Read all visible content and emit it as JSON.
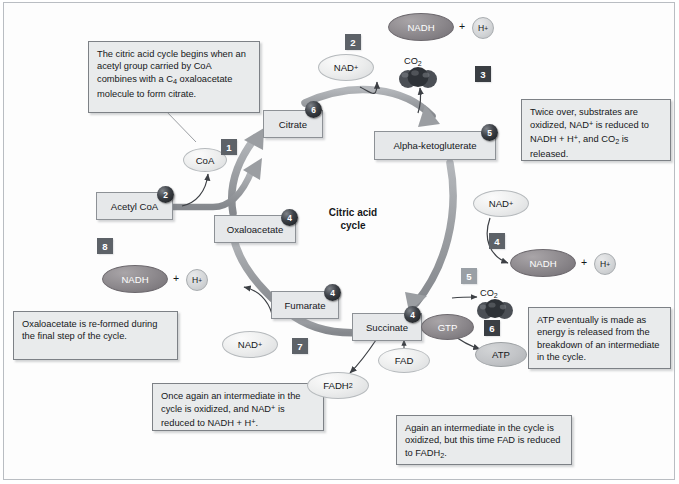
{
  "diagram": {
    "center_title_line1": "Citric acid",
    "center_title_line2": "cycle"
  },
  "callouts": [
    {
      "id": "callout-intro",
      "html": "The citric acid cycle begins when an acetyl group carried by CoA combines with a C<sub>4</sub> oxaloacetate molecule to form citrate."
    },
    {
      "id": "callout-oxidized-twice",
      "html": "Twice over, substrates are oxidized, NAD<sup>+</sup> is reduced to NADH + H<sup>+</sup>, and CO<sub>2</sub> is released."
    },
    {
      "id": "callout-atp",
      "html": "ATP eventually is made as energy is released from the breakdown of an intermediate in the cycle."
    },
    {
      "id": "callout-fad",
      "html": "Again an intermediate in the cycle is oxidized, but this time FAD is reduced to FADH<sub>2</sub>."
    },
    {
      "id": "callout-nad-again",
      "html": "Once again an intermediate in the cycle is oxidized, and NAD<sup>+</sup> is reduced to NADH + H<sup>+</sup>."
    },
    {
      "id": "callout-oxaloacetate-reformed",
      "html": "Oxaloacetate is re-formed during the final step of the cycle."
    }
  ],
  "metabolites": [
    {
      "id": "metab-citrate",
      "label": "Citrate",
      "carbons": "6"
    },
    {
      "id": "metab-alpha-ketogluterate",
      "label": "Alpha-ketogluterate",
      "carbons": "5"
    },
    {
      "id": "metab-acetyl-coa",
      "label": "Acetyl CoA",
      "carbons": "2"
    },
    {
      "id": "metab-oxaloacetate",
      "label": "Oxaloacetate",
      "carbons": "4"
    },
    {
      "id": "metab-fumarate",
      "label": "Fumarate",
      "carbons": "4"
    },
    {
      "id": "metab-succinate",
      "label": "Succinate",
      "carbons": "4"
    }
  ],
  "molecules": {
    "coa": "CoA",
    "nad_top": "NAD<sup>+</sup>",
    "nadh_top": "NADH",
    "hplus_top": "H<sup>+</sup>",
    "co2_top": "CO<sub>2</sub>",
    "nad_right": "NAD<sup>+</sup>",
    "nadh_right": "NADH",
    "hplus_right": "H<sup>+</sup>",
    "co2_right": "CO<sub>2</sub>",
    "nadh_left": "NADH",
    "hplus_left": "H<sup>+</sup>",
    "nad_bottom": "NAD<sup>+</sup>",
    "gtp": "GTP",
    "atp": "ATP",
    "fad": "FAD",
    "fadh2": "FADH<sub>2</sub>",
    "plus_top": "+",
    "plus_right": "+",
    "plus_left": "+"
  },
  "steps": [
    {
      "id": "step-1",
      "label": "1"
    },
    {
      "id": "step-2",
      "label": "2"
    },
    {
      "id": "step-3",
      "label": "3"
    },
    {
      "id": "step-4",
      "label": "4"
    },
    {
      "id": "step-5",
      "label": "5"
    },
    {
      "id": "step-6",
      "label": "6"
    },
    {
      "id": "step-7",
      "label": "7"
    },
    {
      "id": "step-8",
      "label": "8"
    }
  ],
  "colors": {
    "page_background": "#ffffff",
    "callout_fill": "#e9ebec",
    "callout_border": "#7d8186",
    "metabolite_fill": "#e6e8ea",
    "metabolite_border": "#8d9196",
    "cycle_arrow": "#9b9ea2",
    "thin_arrow": "#3d4045",
    "step_box": "#5d6268",
    "carbon_badge": "#16181b",
    "nadh_oval": "#8e8a8e",
    "gtp_oval": "#8e8a8e",
    "text": "#15171a"
  },
  "chart_data": {
    "type": "diagram",
    "title": "Citric acid cycle",
    "nodes": [
      {
        "name": "Acetyl CoA",
        "carbons": 2
      },
      {
        "name": "Oxaloacetate",
        "carbons": 4
      },
      {
        "name": "Citrate",
        "carbons": 6
      },
      {
        "name": "Alpha-ketogluterate",
        "carbons": 5
      },
      {
        "name": "Succinate",
        "carbons": 4
      },
      {
        "name": "Fumarate",
        "carbons": 4
      }
    ],
    "steps": [
      {
        "number": 1,
        "description": "CoA is released as acetyl group joins oxaloacetate to form citrate"
      },
      {
        "number": 2,
        "description": "NAD+ is reduced to NADH + H+"
      },
      {
        "number": 3,
        "description": "CO2 is released"
      },
      {
        "number": 4,
        "description": "NAD+ is reduced to NADH + H+"
      },
      {
        "number": 5,
        "description": "CO2 is released"
      },
      {
        "number": 6,
        "description": "GTP is formed and converted to ATP"
      },
      {
        "number": 7,
        "description": "FAD is reduced to FADH2"
      },
      {
        "number": 8,
        "description": "NAD+ is reduced to NADH + H+ and oxaloacetate is re-formed"
      }
    ]
  }
}
